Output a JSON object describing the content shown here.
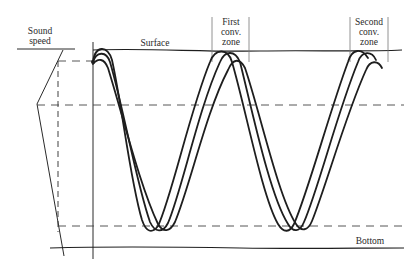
{
  "figure": {
    "type": "sound ray propagation diagram with convergence zones",
    "colors": {
      "ink": "#1e1e1e",
      "dashed": "#444444",
      "background": "#ffffff"
    }
  },
  "labels": {
    "sound_speed": [
      "Sound",
      "speed"
    ],
    "surface": "Surface",
    "first_zone": [
      "First",
      "conv.",
      "zone"
    ],
    "second_zone": [
      "Second",
      "conv.",
      "zone"
    ],
    "bottom": "Bottom"
  },
  "elements": {
    "rays": {
      "count": 3,
      "source_side": "left",
      "cycles_shown": 2
    },
    "sound_speed_profile": {
      "shape": "minimum at mid-depth (dashed horizontal at ~y=102)"
    },
    "reference_lines": [
      "surface",
      "bottom",
      "axis dashed line",
      "lower turning dashed line",
      "upper dashed line near source"
    ]
  }
}
